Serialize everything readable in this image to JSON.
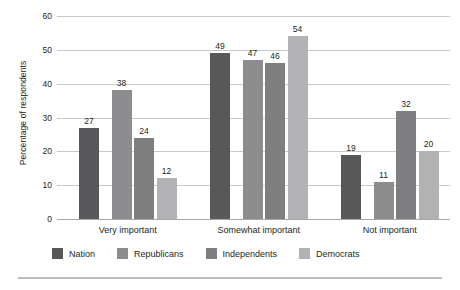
{
  "chart_data": {
    "type": "bar",
    "title": "",
    "xlabel": "",
    "ylabel": "Percentage of respondents",
    "categories": [
      "Very important",
      "Somewhat important",
      "Not important"
    ],
    "series": [
      {
        "name": "Nation",
        "color": "#58585a",
        "values": [
          27,
          38,
          19
        ]
      },
      {
        "name": "Republicans",
        "color": "#8d8d8f",
        "values": [
          38,
          47,
          11
        ]
      },
      {
        "name": "Independents",
        "color": "#7e7e80",
        "values": [
          24,
          46,
          32
        ]
      },
      {
        "name": "Democrats",
        "color": "#b2b2b4",
        "values": [
          12,
          54,
          20
        ]
      }
    ],
    "group_values": [
      [
        27,
        38,
        24,
        12
      ],
      [
        49,
        47,
        46,
        54
      ],
      [
        19,
        11,
        32,
        20
      ]
    ],
    "ylim": [
      0,
      60
    ],
    "yticks": [
      0,
      10,
      20,
      30,
      40,
      50,
      60
    ],
    "ytick_labels": [
      "0",
      "10",
      "20",
      "30",
      "40",
      "50",
      "60"
    ],
    "grid": true,
    "legend_position": "bottom-left",
    "data_labels": true
  },
  "legend": {
    "items": [
      {
        "label": "Nation",
        "color": "#58585a"
      },
      {
        "label": "Republicans",
        "color": "#8d8d8f"
      },
      {
        "label": "Independents",
        "color": "#7e7e80"
      },
      {
        "label": "Democrats",
        "color": "#b2b2b4"
      }
    ]
  }
}
